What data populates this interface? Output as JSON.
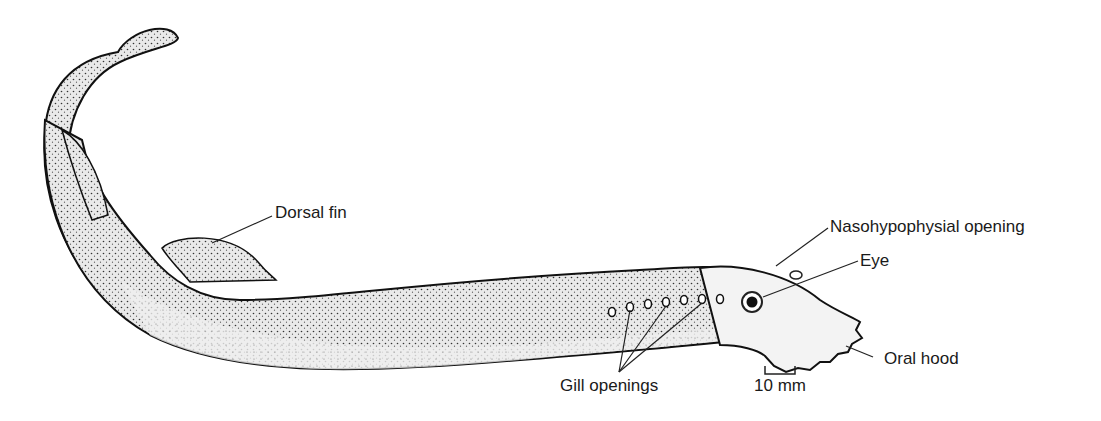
{
  "diagram": {
    "labels": {
      "dorsal_fin": "Dorsal fin",
      "nasohypophysial_opening": "Nasohypophysial opening",
      "eye": "Eye",
      "oral_hood": "Oral hood",
      "gill_openings": "Gill openings",
      "scale_bar": "10 mm"
    }
  }
}
